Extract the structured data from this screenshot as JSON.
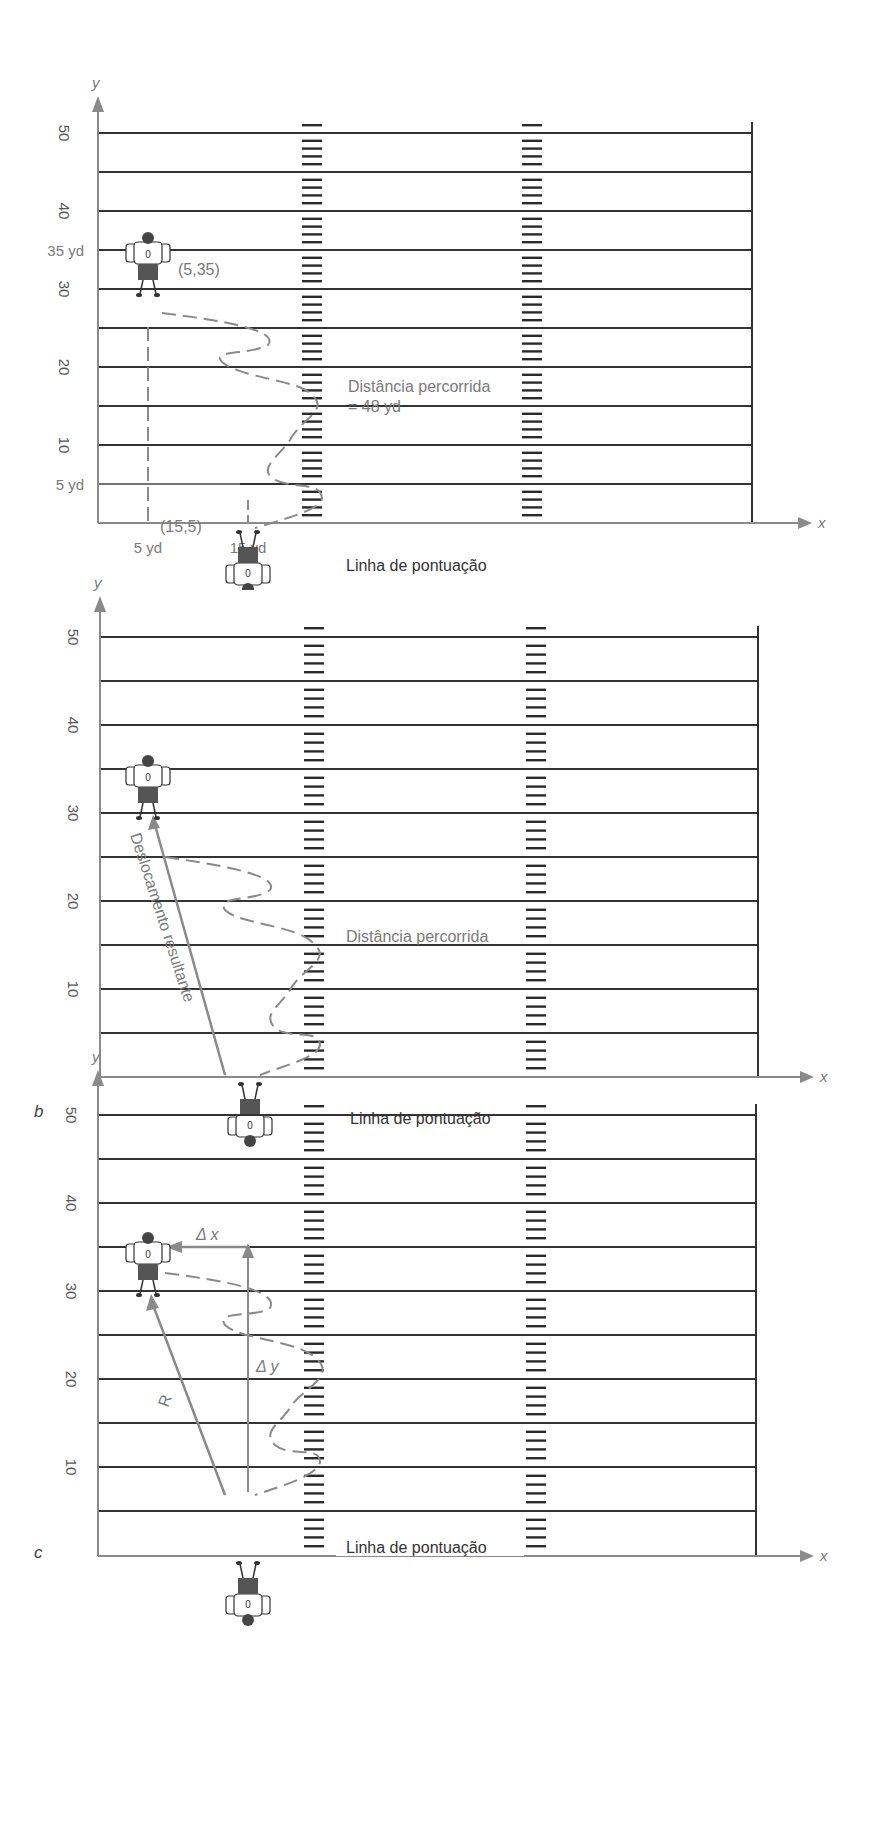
{
  "colors": {
    "field_line": "#333333",
    "axis": "#8a8a8a",
    "annotation": "#7a7a7a",
    "hash": "#2a2a2a",
    "background": "#ffffff"
  },
  "axes": {
    "x_label": "x",
    "y_label": "y"
  },
  "y_ticks": [
    "50",
    "40",
    "30",
    "20",
    "10"
  ],
  "field": {
    "yard_lines": [
      50,
      45,
      40,
      35,
      30,
      25,
      20,
      15,
      10,
      5
    ],
    "goal_line_label": "Linha de pontuação"
  },
  "panels": [
    {
      "id": "a",
      "letter": "a",
      "start_label": "(15,5)",
      "end_label": "(5,35)",
      "y_markers": [
        "35 yd",
        "5 yd"
      ],
      "x_markers": [
        "5 yd",
        "15 yd"
      ],
      "distance_label_line1": "Distância percorrida",
      "distance_label_line2": "= 48 yd"
    },
    {
      "id": "b",
      "letter": "b",
      "distance_label_line1": "Distância percorrida",
      "displacement_label": "Deslocamento resultante"
    },
    {
      "id": "c",
      "letter": "c",
      "delta_x_label": "Δ x",
      "delta_y_label": "Δ y",
      "resultant_label": "R"
    }
  ],
  "chart_data": {
    "type": "diagram",
    "xlabel": "x",
    "ylabel": "y",
    "y_ticks": [
      10,
      20,
      30,
      40,
      50
    ],
    "units": "yd",
    "start_point": {
      "x": 15,
      "y": 5,
      "label": "(15,5)"
    },
    "end_point": {
      "x": 5,
      "y": 35,
      "label": "(5,35)"
    },
    "distance_traveled_yd": 48,
    "delta_x_yd": -10,
    "delta_y_yd": 30,
    "panels": [
      "a",
      "b",
      "c"
    ]
  }
}
